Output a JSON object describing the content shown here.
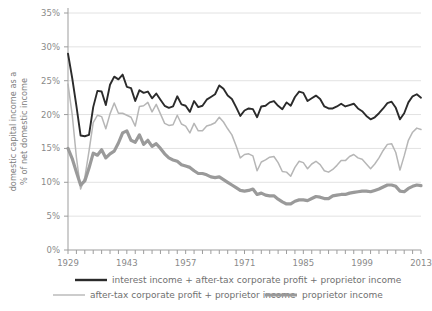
{
  "chart_data": {
    "type": "line",
    "title": "",
    "xlabel": "",
    "ylabel": "domestic capital income as a % of net domestic income",
    "ylabel_line1": "domestic capital income as a",
    "ylabel_line2": "% of net domestic income",
    "xlim": [
      1929,
      2013
    ],
    "ylim": [
      0,
      35
    ],
    "ytick_labels": [
      "0%",
      "5%",
      "10%",
      "15%",
      "20%",
      "25%",
      "30%",
      "35%"
    ],
    "ytick_values": [
      0,
      5,
      10,
      15,
      20,
      25,
      30,
      35
    ],
    "xtick_labels": [
      "1929",
      "1943",
      "1957",
      "1971",
      "1985",
      "1999",
      "2013"
    ],
    "xtick_values": [
      1929,
      1943,
      1957,
      1971,
      1985,
      1999,
      2013
    ],
    "minor_tick_interval": 2,
    "grid": "horizontal",
    "legend_position": "bottom",
    "x": [
      1929,
      1930,
      1931,
      1932,
      1933,
      1934,
      1935,
      1936,
      1937,
      1938,
      1939,
      1940,
      1941,
      1942,
      1943,
      1944,
      1945,
      1946,
      1947,
      1948,
      1949,
      1950,
      1951,
      1952,
      1953,
      1954,
      1955,
      1956,
      1957,
      1958,
      1959,
      1960,
      1961,
      1962,
      1963,
      1964,
      1965,
      1966,
      1967,
      1968,
      1969,
      1970,
      1971,
      1972,
      1973,
      1974,
      1975,
      1976,
      1977,
      1978,
      1979,
      1980,
      1981,
      1982,
      1983,
      1984,
      1985,
      1986,
      1987,
      1988,
      1989,
      1990,
      1991,
      1992,
      1993,
      1994,
      1995,
      1996,
      1997,
      1998,
      1999,
      2000,
      2001,
      2002,
      2003,
      2004,
      2005,
      2006,
      2007,
      2008,
      2009,
      2010,
      2011,
      2012,
      2013
    ],
    "series": [
      {
        "name": "interest income + after-tax corporate profit + proprietor income",
        "color": "#2b2b2b",
        "width": 1.9,
        "values": [
          29.0,
          25.4,
          21.3,
          16.9,
          16.8,
          17.0,
          21.1,
          23.5,
          23.4,
          21.4,
          24.4,
          25.6,
          25.2,
          25.9,
          24.1,
          23.9,
          22.0,
          23.6,
          23.2,
          23.4,
          22.4,
          23.1,
          22.2,
          21.3,
          21.0,
          21.2,
          22.7,
          21.5,
          21.3,
          20.4,
          22.0,
          21.1,
          21.3,
          22.2,
          22.6,
          23.0,
          24.3,
          23.8,
          22.8,
          22.3,
          21.1,
          19.8,
          20.6,
          20.9,
          20.8,
          19.6,
          21.2,
          21.3,
          21.8,
          22.0,
          21.3,
          20.8,
          21.8,
          21.3,
          22.6,
          23.4,
          23.2,
          22.0,
          22.4,
          22.8,
          22.3,
          21.2,
          20.9,
          20.9,
          21.2,
          21.6,
          21.2,
          21.4,
          21.6,
          20.9,
          20.5,
          19.8,
          19.3,
          19.6,
          20.2,
          20.9,
          21.7,
          21.9,
          21.0,
          19.3,
          20.2,
          21.8,
          22.7,
          23.0,
          22.5
        ]
      },
      {
        "name": "after-tax corporate profit + proprietor income",
        "color": "#b6b6b6",
        "width": 1.5,
        "values": [
          24.5,
          20.0,
          13.7,
          9.0,
          10.7,
          14.6,
          18.8,
          19.9,
          19.7,
          17.9,
          20.1,
          21.7,
          20.2,
          20.2,
          19.9,
          19.6,
          18.3,
          21.2,
          21.3,
          21.8,
          20.4,
          21.5,
          20.1,
          18.7,
          18.4,
          18.5,
          19.9,
          18.6,
          18.3,
          17.3,
          18.7,
          17.6,
          17.6,
          18.3,
          18.5,
          18.8,
          19.6,
          18.9,
          17.9,
          17.0,
          15.4,
          13.6,
          14.1,
          14.2,
          13.9,
          11.7,
          13.0,
          13.3,
          13.7,
          13.8,
          12.9,
          11.6,
          11.5,
          10.9,
          12.2,
          13.1,
          12.9,
          12.0,
          12.7,
          13.1,
          12.6,
          11.7,
          11.5,
          11.9,
          12.5,
          13.2,
          13.2,
          13.8,
          14.1,
          13.6,
          13.4,
          12.7,
          12.0,
          12.7,
          13.6,
          14.7,
          15.6,
          15.7,
          14.4,
          11.8,
          13.9,
          16.2,
          17.4,
          18.0,
          17.8
        ]
      },
      {
        "name": "proprietor income",
        "color": "#9a9a9a",
        "width": 3.2,
        "values": [
          15.0,
          13.5,
          11.5,
          9.6,
          10.2,
          12.1,
          14.3,
          14.0,
          14.8,
          13.6,
          14.2,
          14.6,
          15.8,
          17.3,
          17.6,
          16.2,
          15.9,
          17.0,
          15.6,
          16.2,
          15.3,
          15.7,
          15.0,
          14.2,
          13.6,
          13.3,
          13.1,
          12.6,
          12.4,
          12.2,
          11.7,
          11.3,
          11.3,
          11.1,
          10.8,
          10.7,
          10.8,
          10.4,
          10.0,
          9.6,
          9.2,
          8.8,
          8.7,
          8.8,
          9.0,
          8.2,
          8.4,
          8.1,
          8.0,
          8.0,
          7.5,
          7.1,
          6.8,
          6.8,
          7.2,
          7.4,
          7.4,
          7.3,
          7.6,
          7.9,
          7.8,
          7.6,
          7.6,
          8.0,
          8.1,
          8.2,
          8.2,
          8.4,
          8.5,
          8.6,
          8.7,
          8.7,
          8.6,
          8.8,
          9.0,
          9.3,
          9.6,
          9.6,
          9.4,
          8.7,
          8.6,
          9.1,
          9.4,
          9.6,
          9.5
        ]
      }
    ],
    "legend": [
      {
        "label": "interest income + after-tax corporate profit + proprietor income",
        "color": "#2b2b2b",
        "width": 2.4
      },
      {
        "label": "after-tax corporate profit + proprietor income",
        "color": "#b6b6b6",
        "width": 1.4
      },
      {
        "label": "proprietor income",
        "color": "#9a9a9a",
        "width": 3.0
      }
    ],
    "colors": {
      "grid": "#e2e2e2",
      "axis": "#9d9d9d",
      "tick_text": "#8a8a8a",
      "background": "#ffffff"
    }
  }
}
